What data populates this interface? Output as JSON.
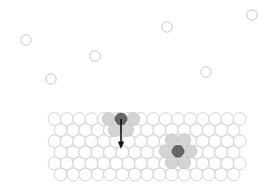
{
  "figure": {
    "title": "",
    "background_color": "#ffffff",
    "width": 271,
    "height": 192
  },
  "colors": {
    "lattice_fill": "#ffffff",
    "lattice_stroke": "#c9c9c9",
    "gas_stroke": "#c2c2c2",
    "dark_atom": "#666666",
    "shaded_atom": "#d4d4d4",
    "arrow": "#111111"
  },
  "chart_data": {
    "type": "scatter",
    "title": "",
    "xlabel": "",
    "ylabel": "",
    "xlim": [
      0,
      271
    ],
    "ylim": [
      0,
      192
    ],
    "grid": false,
    "legend": "none",
    "series": [
      {
        "name": "gas-phase atoms",
        "marker": "open-circle",
        "radius": 5.2,
        "points": [
          {
            "x": 26,
            "y": 40
          },
          {
            "x": 95,
            "y": 56
          },
          {
            "x": 167,
            "y": 27
          },
          {
            "x": 252,
            "y": 15
          },
          {
            "x": 51,
            "y": 79
          },
          {
            "x": 206,
            "y": 72
          }
        ]
      },
      {
        "name": "substrate lattice atoms",
        "marker": "open-circle",
        "radius": 6.4,
        "rows": 6,
        "row_spacing": 11.1,
        "col_spacing": 12.35,
        "origin": {
          "x": 54.5,
          "y": 119.0
        },
        "columns_even_row": 16,
        "columns_odd_row": 15,
        "odd_row_offset": 6.18
      },
      {
        "name": "dark marked atoms",
        "marker": "filled-circle",
        "radius": 6.0,
        "points": [
          {
            "x": 121.0,
            "y": 119.0,
            "label": "adatom"
          },
          {
            "x": 178.0,
            "y": 151.3,
            "label": "substitutional atom"
          }
        ]
      },
      {
        "name": "shaded neighbour atoms",
        "marker": "filled-circle",
        "radius": 6.4,
        "points": [
          {
            "x": 108.7,
            "y": 119.0
          },
          {
            "x": 133.3,
            "y": 119.0
          },
          {
            "x": 114.8,
            "y": 130.1
          },
          {
            "x": 127.2,
            "y": 130.1
          },
          {
            "x": 165.7,
            "y": 151.3
          },
          {
            "x": 190.4,
            "y": 151.3
          },
          {
            "x": 171.8,
            "y": 140.2
          },
          {
            "x": 184.2,
            "y": 140.2
          },
          {
            "x": 171.8,
            "y": 162.4
          },
          {
            "x": 184.2,
            "y": 162.4
          }
        ]
      }
    ],
    "annotations": [
      {
        "type": "arrow",
        "name": "downward-incorporation-arrow",
        "x1": 121.0,
        "y1": 119.0,
        "x2": 121.0,
        "y2": 149.0,
        "direction": "down",
        "color": "#111111"
      }
    ]
  },
  "labels": {
    "gas_region": "gas phase",
    "solid_region": "crystal surface",
    "arrow_meaning": "atom incorporation into surface"
  }
}
